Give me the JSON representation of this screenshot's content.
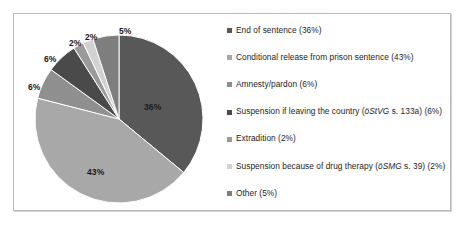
{
  "chart_data": {
    "type": "pie",
    "title": "",
    "subtitle": "",
    "xlabel": "",
    "ylabel": "",
    "grid": false,
    "legend_position": "right",
    "start_angle_deg": -90,
    "direction": "clockwise",
    "categories": [
      "End of sentence",
      "Conditional release from prison sentence",
      "Amnesty/pardon",
      "Suspension if leaving the country (öStVG s. 133a)",
      "Extradition",
      "Suspension because of drug therapy (öSMG s. 39)",
      "Other"
    ],
    "values": [
      36,
      43,
      6,
      6,
      2,
      2,
      5
    ],
    "value_unit": "%",
    "slice_labels": [
      "36%",
      "43%",
      "6%",
      "6%",
      "2%",
      "2%",
      "5%"
    ],
    "colors": [
      "#585858",
      "#a8a8a8",
      "#8f8f8f",
      "#4a4a4a",
      "#9a9a9a",
      "#d2d2d2",
      "#7e7e7e"
    ]
  },
  "legend": {
    "items": [
      {
        "swatch_color": "#585858",
        "prefix": "End of sentence (36%)",
        "italic": "",
        "suffix": ""
      },
      {
        "swatch_color": "#a8a8a8",
        "prefix": "Conditional release from prison sentence (43%)",
        "italic": "",
        "suffix": ""
      },
      {
        "swatch_color": "#8f8f8f",
        "prefix": "Amnesty/pardon (6%)",
        "italic": "",
        "suffix": ""
      },
      {
        "swatch_color": "#4a4a4a",
        "prefix": "Suspension if leaving the country (",
        "italic": "öStVG",
        "suffix": " s. 133a) (6%)"
      },
      {
        "swatch_color": "#9a9a9a",
        "prefix": "Extradition (2%)",
        "italic": "",
        "suffix": ""
      },
      {
        "swatch_color": "#d2d2d2",
        "prefix": "Suspension because of drug therapy (",
        "italic": "öSMG",
        "suffix": " s. 39) (2%)"
      },
      {
        "swatch_color": "#7e7e7e",
        "prefix": "Other (5%)",
        "italic": "",
        "suffix": ""
      }
    ]
  },
  "pie_labels": [
    {
      "text": "36%",
      "left": "130px",
      "top": "88px"
    },
    {
      "text": "43%",
      "left": "73px",
      "top": "153px"
    },
    {
      "text": "6%",
      "left": "14px",
      "top": "68px"
    },
    {
      "text": "6%",
      "left": "30px",
      "top": "40px"
    },
    {
      "text": "2%",
      "left": "55px",
      "top": "24px"
    },
    {
      "text": "2%",
      "left": "71px",
      "top": "18px"
    },
    {
      "text": "5%",
      "left": "105px",
      "top": "12px"
    }
  ],
  "geometry": {
    "center_x": 105,
    "center_y": 105,
    "radius": 84
  }
}
